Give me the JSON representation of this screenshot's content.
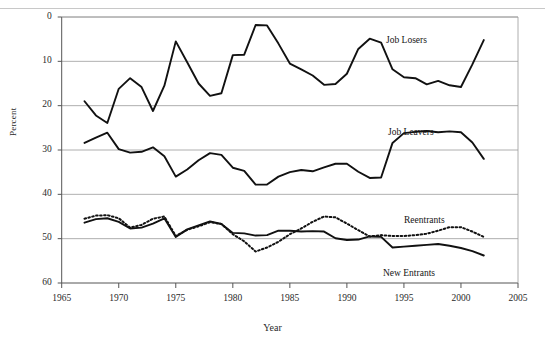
{
  "chart_data": {
    "type": "line",
    "title": "",
    "xlabel": "Year",
    "ylabel": "Percent",
    "xlim": [
      1965,
      2005
    ],
    "ylim": [
      0,
      60
    ],
    "xticks": [
      1965,
      1970,
      1975,
      1980,
      1985,
      1990,
      1995,
      2000,
      2005
    ],
    "yticks": [
      0,
      10,
      20,
      30,
      40,
      50,
      60
    ],
    "grid": "horizontal",
    "legend": "inline-annotations",
    "x": [
      1967,
      1968,
      1969,
      1970,
      1971,
      1972,
      1973,
      1974,
      1975,
      1976,
      1977,
      1978,
      1979,
      1980,
      1981,
      1982,
      1983,
      1984,
      1985,
      1986,
      1987,
      1988,
      1989,
      1990,
      1991,
      1992,
      1993,
      1994,
      1995,
      1996,
      1997,
      1998,
      1999,
      2000,
      2001,
      2002
    ],
    "series": [
      {
        "name": "Job Losers",
        "style": "solid",
        "color": "#111111",
        "values": [
          41.0,
          37.8,
          36.1,
          43.8,
          46.2,
          44.2,
          38.8,
          44.5,
          54.5,
          49.8,
          45.0,
          42.2,
          42.8,
          51.4,
          51.5,
          58.2,
          58.1,
          54.0,
          49.5,
          48.2,
          46.8,
          44.7,
          44.9,
          47.2,
          52.8,
          55.1,
          54.2,
          48.2,
          46.4,
          46.2,
          44.8,
          45.6,
          44.6,
          44.2,
          49.3,
          54.8
        ]
      },
      {
        "name": "Job Leavers",
        "style": "solid",
        "color": "#111111",
        "values": [
          31.6,
          32.8,
          33.9,
          30.2,
          29.4,
          29.6,
          30.6,
          28.6,
          24.0,
          25.6,
          27.7,
          29.3,
          28.9,
          26.0,
          25.3,
          22.2,
          22.2,
          24.0,
          25.0,
          25.5,
          25.2,
          26.1,
          26.9,
          26.9,
          25.1,
          23.7,
          23.8,
          31.6,
          33.8,
          34.1,
          34.3,
          34.0,
          34.2,
          34.0,
          31.7,
          28.0
        ]
      },
      {
        "name": "Reentrants",
        "style": "dotted",
        "color": "#111111",
        "values": [
          14.5,
          15.2,
          15.3,
          14.6,
          12.5,
          13.1,
          14.5,
          15.0,
          10.6,
          12.0,
          12.8,
          13.7,
          13.3,
          11.0,
          9.4,
          7.1,
          8.0,
          9.3,
          11.0,
          12.3,
          13.8,
          15.0,
          14.8,
          13.4,
          11.9,
          10.5,
          10.8,
          10.6,
          10.6,
          10.8,
          11.1,
          11.8,
          12.6,
          12.6,
          11.6,
          10.4
        ]
      },
      {
        "name": "New Entrants",
        "style": "solid",
        "color": "#111111",
        "values": [
          13.6,
          14.4,
          14.6,
          13.8,
          12.3,
          12.5,
          13.4,
          14.6,
          10.4,
          12.1,
          13.0,
          13.9,
          13.3,
          11.3,
          11.2,
          10.7,
          10.8,
          11.8,
          11.8,
          11.6,
          11.7,
          11.6,
          10.1,
          9.7,
          9.8,
          10.5,
          10.4,
          8.0,
          8.2,
          8.4,
          8.6,
          8.8,
          8.4,
          7.9,
          7.2,
          6.2
        ]
      }
    ],
    "annotations": [
      {
        "label": "Job Losers",
        "x_px": 386,
        "y_px": 35
      },
      {
        "label": "Job Leavers",
        "x_px": 388,
        "y_px": 127
      },
      {
        "label": "Reentrants",
        "x_px": 404,
        "y_px": 215
      },
      {
        "label": "New Entrants",
        "x_px": 383,
        "y_px": 268
      }
    ]
  },
  "axis": {
    "ylabel": "Percent",
    "xlabel": "Year",
    "yticks": [
      "60",
      "50",
      "40",
      "30",
      "20",
      "10",
      "0"
    ],
    "xticks": [
      "1965",
      "1970",
      "1975",
      "1980",
      "1985",
      "1990",
      "1995",
      "2000",
      "2005"
    ]
  }
}
